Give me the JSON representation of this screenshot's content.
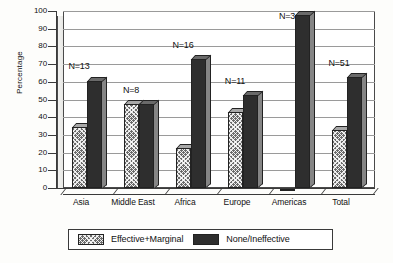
{
  "chart_data": {
    "type": "bar",
    "title": "",
    "xlabel": "",
    "ylabel": "Percentage",
    "ylim": [
      0,
      100
    ],
    "ytick_step": 10,
    "yticks": [
      "0",
      "10",
      "20",
      "30",
      "40",
      "50",
      "60",
      "70",
      "80",
      "90",
      "100"
    ],
    "grid": true,
    "legend_position": "bottom",
    "categories": [
      "Asia",
      "Middle East",
      "Africa",
      "Europe",
      "Americas",
      "Total"
    ],
    "series": [
      {
        "name": "Effective+Marginal",
        "pattern": "hatched",
        "values": [
          37,
          50,
          25,
          45,
          0,
          35
        ]
      },
      {
        "name": "None/Ineffective",
        "pattern": "solid",
        "values": [
          63,
          50,
          75,
          55,
          100,
          65
        ]
      }
    ],
    "annotations": [
      {
        "label": "N=13",
        "category": "Asia"
      },
      {
        "label": "N=8",
        "category": "Middle East"
      },
      {
        "label": "N=16",
        "category": "Africa"
      },
      {
        "label": "N=11",
        "category": "Europe"
      },
      {
        "label": "N=3",
        "category": "Americas"
      },
      {
        "label": "N=51",
        "category": "Total"
      }
    ]
  },
  "legend": {
    "items": [
      {
        "label": "Effective+Marginal"
      },
      {
        "label": "None/Ineffective"
      }
    ]
  },
  "axis": {
    "y_title": "Percentage"
  }
}
